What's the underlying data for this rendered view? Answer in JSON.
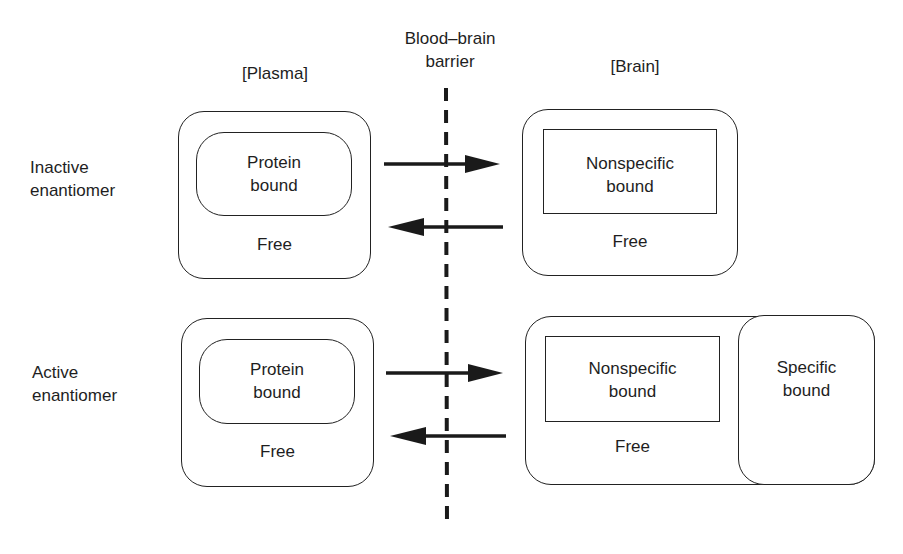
{
  "diagram": {
    "column_headers": {
      "plasma": "[Plasma]",
      "barrier_line1": "Blood–brain",
      "barrier_line2": "barrier",
      "brain": "[Brain]"
    },
    "rows": [
      {
        "label_line1": "Inactive",
        "label_line2": "enantiomer",
        "plasma": {
          "inner_line1": "Protein",
          "inner_line2": "bound",
          "outer": "Free"
        },
        "brain": {
          "inner_line1": "Nonspecific",
          "inner_line2": "bound",
          "outer": "Free"
        }
      },
      {
        "label_line1": "Active",
        "label_line2": "enantiomer",
        "plasma": {
          "inner_line1": "Protein",
          "inner_line2": "bound",
          "outer": "Free"
        },
        "brain": {
          "inner_line1": "Nonspecific",
          "inner_line2": "bound",
          "outer": "Free",
          "specific_line1": "Specific",
          "specific_line2": "bound"
        }
      }
    ],
    "arrows": [
      {
        "from": "plasma",
        "to": "brain",
        "row": "inactive"
      },
      {
        "from": "brain",
        "to": "plasma",
        "row": "inactive"
      },
      {
        "from": "plasma",
        "to": "brain",
        "row": "active"
      },
      {
        "from": "brain",
        "to": "plasma",
        "row": "active"
      }
    ],
    "colors": {
      "stroke": "#222222",
      "background": "#ffffff"
    }
  }
}
